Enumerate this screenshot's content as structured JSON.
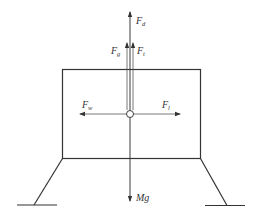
{
  "diagram": {
    "type": "free-body-diagram",
    "forces": {
      "Fd": {
        "symbol": "F",
        "subscript": "d",
        "direction": "up"
      },
      "Fg": {
        "symbol": "F",
        "subscript": "g",
        "direction": "up"
      },
      "Ft": {
        "symbol": "F",
        "subscript": "t",
        "direction": "up"
      },
      "Fw": {
        "symbol": "F",
        "subscript": "w",
        "direction": "left"
      },
      "Fl": {
        "symbol": "F",
        "subscript": "l",
        "direction": "right"
      },
      "Mg": {
        "symbol": "Mg",
        "direction": "down"
      }
    }
  }
}
